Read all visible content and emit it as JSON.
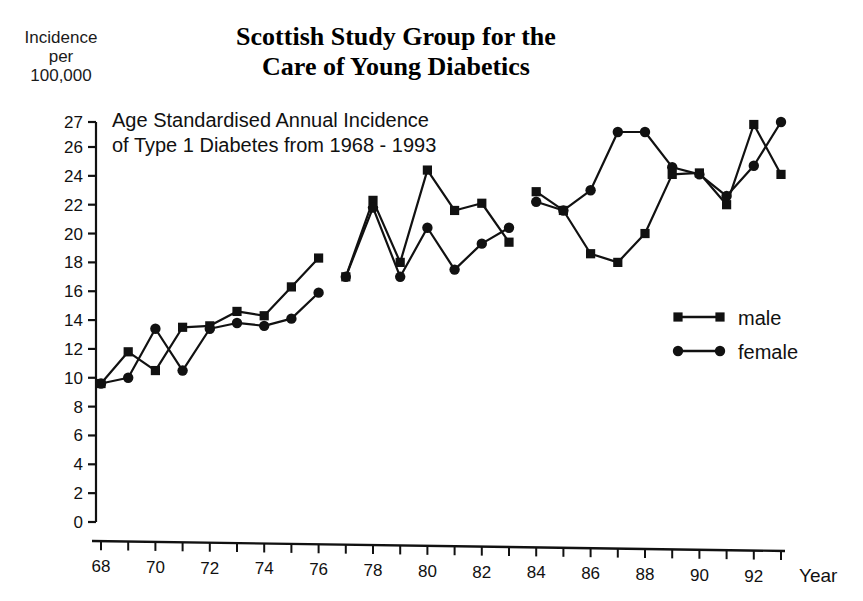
{
  "title": {
    "line1": "Scottish Study Group for the",
    "line2": "Care of Young Diabetics"
  },
  "subtitle": {
    "line1": "Age Standardised Annual Incidence",
    "line2": "of Type  1 Diabetes from 1968 - 1993"
  },
  "y_axis_caption": {
    "line1": "Incidence",
    "line2": "per",
    "line3": "100,000"
  },
  "x_axis_name": "Year",
  "legend": {
    "male_label": "male",
    "female_label": "female"
  },
  "colors": {
    "ink": "#111111",
    "background": "#ffffff"
  },
  "chart_data": {
    "type": "line",
    "title": "Scottish Study Group for the Care of Young Diabetics",
    "subtitle": "Age Standardised Annual Incidence of Type 1 Diabetes from 1968 - 1993",
    "xlabel": "Year",
    "ylabel": "Incidence per 100,000",
    "xlim": [
      68,
      93
    ],
    "ylim": [
      0,
      27
    ],
    "grid": false,
    "legend_position": "right-middle",
    "x_ticks": [
      68,
      69,
      70,
      71,
      72,
      73,
      74,
      75,
      76,
      77,
      78,
      79,
      80,
      81,
      82,
      83,
      84,
      85,
      86,
      87,
      88,
      89,
      90,
      91,
      92,
      93
    ],
    "x_tick_labels": [
      "68",
      "",
      "70",
      "",
      "72",
      "",
      "74",
      "",
      "76",
      "",
      "78",
      "",
      "80",
      "",
      "82",
      "",
      "84",
      "",
      "86",
      "",
      "88",
      "",
      "90",
      "",
      "92",
      ""
    ],
    "y_ticks": [
      0,
      2,
      4,
      6,
      8,
      10,
      12,
      14,
      16,
      18,
      20,
      22,
      24,
      26,
      27
    ],
    "y_tick_labels": [
      "0",
      "2",
      "4",
      "6",
      "8",
      "10",
      "12",
      "14",
      "16",
      "18",
      "20",
      "22",
      "24",
      "26",
      "27"
    ],
    "series": [
      {
        "name": "male",
        "marker": "square",
        "segments": [
          {
            "x": [
              68,
              69,
              70,
              71,
              72,
              73,
              74,
              75,
              76
            ],
            "values": [
              9.6,
              11.8,
              10.5,
              13.5,
              13.6,
              14.6,
              14.3,
              16.3,
              18.3
            ]
          },
          {
            "x": [
              77,
              78,
              79,
              80,
              81,
              82,
              83
            ],
            "values": [
              17.0,
              22.3,
              18.0,
              24.4,
              21.6,
              22.1,
              19.4
            ]
          },
          {
            "x": [
              84,
              85,
              86,
              87,
              88,
              89,
              90,
              91,
              92,
              93
            ],
            "values": [
              22.9,
              21.6,
              18.6,
              18.0,
              20.0,
              24.1,
              24.2,
              22.0,
              26.9,
              24.1
            ]
          }
        ]
      },
      {
        "name": "female",
        "marker": "circle",
        "segments": [
          {
            "x": [
              68,
              69,
              70,
              71,
              72,
              73,
              74,
              75,
              76
            ],
            "values": [
              9.6,
              10.0,
              13.4,
              10.5,
              13.4,
              13.8,
              13.6,
              14.1,
              15.9
            ]
          },
          {
            "x": [
              77,
              78,
              79,
              80,
              81,
              82,
              83
            ],
            "values": [
              17.0,
              21.8,
              17.0,
              20.4,
              17.5,
              19.3,
              20.4
            ]
          },
          {
            "x": [
              84,
              85,
              86,
              87,
              88,
              89,
              90,
              91,
              92,
              93
            ],
            "values": [
              22.2,
              21.6,
              23.0,
              26.6,
              26.6,
              24.6,
              24.1,
              22.6,
              24.7,
              27.0
            ]
          }
        ]
      }
    ]
  }
}
